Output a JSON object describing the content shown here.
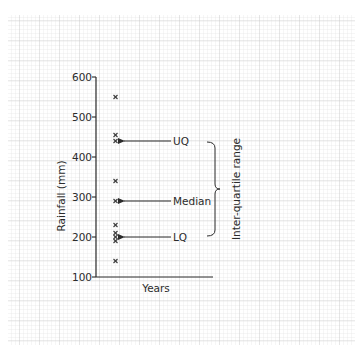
{
  "chart_data": {
    "type": "scatter",
    "title": "",
    "xlabel": "Years",
    "ylabel": "Rainfall (mm)",
    "ylim": [
      100,
      600
    ],
    "yticks": [
      100,
      200,
      300,
      400,
      500,
      600
    ],
    "ytick_labels": [
      "100",
      "200",
      "300",
      "400",
      "500",
      "600"
    ],
    "grid": true,
    "legend": null,
    "series": [
      {
        "name": "Rainfall",
        "marker": "x",
        "values": [
          550,
          455,
          440,
          340,
          290,
          230,
          210,
          200,
          190,
          140
        ]
      }
    ],
    "annotations": [
      {
        "label": "UQ",
        "value": 440,
        "type": "arrow"
      },
      {
        "label": "Median",
        "value": 290,
        "type": "arrow"
      },
      {
        "label": "LQ",
        "value": 200,
        "type": "arrow"
      },
      {
        "label": "Inter-quartile range",
        "from": 200,
        "to": 440,
        "type": "brace"
      }
    ]
  },
  "colors": {
    "ink": "#2b2b2b",
    "grid_minor": "#e4e4e4",
    "grid_major": "#c9c9c9",
    "background": "#ffffff"
  }
}
